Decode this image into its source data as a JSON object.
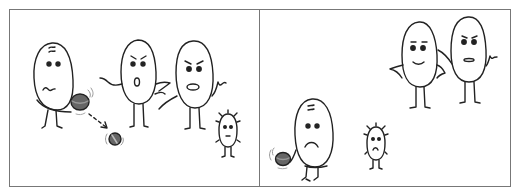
{
  "comic": {
    "panels": [
      {
        "id": "panel-1",
        "description": "A nervous bean character drops a round object; two angry bean characters and a small spiky one look on",
        "characters": [
          "nervous-bean-holding-ball",
          "angry-bean-shouting",
          "angry-bean-frowning",
          "small-spiky-bean"
        ],
        "objects": [
          "dark-ball-in-hand",
          "falling-ball",
          "dashed-motion-arrow"
        ]
      },
      {
        "id": "panel-2",
        "description": "The sad bean holds the ball alone at the left; the small spiky bean looks sad; two beans stand together at the upper right",
        "characters": [
          "sad-bean-holding-ball",
          "small-sad-spiky-bean",
          "smiling-bean-hands-on-hips",
          "neutral-bean-arm-around"
        ],
        "objects": [
          "dark-ball-in-hand"
        ]
      }
    ],
    "colors": {
      "line": "#222222",
      "ball": "#555555",
      "ball_highlight": "#888888",
      "frame": "#777777",
      "background": "#ffffff"
    }
  }
}
